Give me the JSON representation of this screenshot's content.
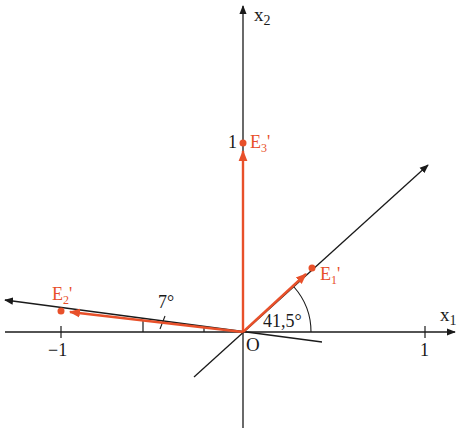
{
  "diagram": {
    "type": "parallel projection of coordinate unit vectors",
    "colors": {
      "axis": "#1a1a1a",
      "vector": "#e8502a",
      "label": "#e8502a",
      "background": "#ffffff"
    },
    "axes": {
      "x1": {
        "label": "x",
        "sub": "1"
      },
      "x2": {
        "label": "x",
        "sub": "2"
      },
      "origin_label": "O"
    },
    "ticks": {
      "x1_pos": "1",
      "x1_neg": "−1",
      "x2_pos": "1"
    },
    "vectors": [
      {
        "name": "E",
        "sub": "1",
        "prime": "'"
      },
      {
        "name": "E",
        "sub": "2",
        "prime": "'"
      },
      {
        "name": "E",
        "sub": "3",
        "prime": "'"
      }
    ],
    "angles": {
      "e1_angle": "41,5°",
      "e2_angle": "7°"
    }
  }
}
